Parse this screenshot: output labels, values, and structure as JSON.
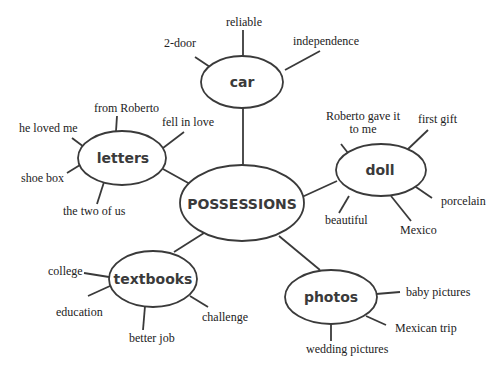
{
  "diagram": {
    "type": "cluster-map",
    "center": {
      "label": "POSSESSIONS"
    },
    "nodes": [
      {
        "id": "car",
        "label": "car",
        "details": [
          "2-door",
          "reliable",
          "independence"
        ]
      },
      {
        "id": "letters",
        "label": "letters",
        "details": [
          "from Roberto",
          "he loved me",
          "fell in love",
          "shoe box",
          "the two of us"
        ]
      },
      {
        "id": "doll",
        "label": "doll",
        "details": [
          "Roberto gave it to me",
          "first gift",
          "porcelain",
          "Mexico",
          "beautiful"
        ]
      },
      {
        "id": "textbooks",
        "label": "textbooks",
        "details": [
          "college",
          "education",
          "better job",
          "challenge"
        ]
      },
      {
        "id": "photos",
        "label": "photos",
        "details": [
          "baby pictures",
          "Mexican trip",
          "wedding pictures"
        ]
      }
    ]
  },
  "labels": {
    "center": "POSSESSIONS",
    "car": "car",
    "car_2door": "2-door",
    "car_reliable": "reliable",
    "car_independence": "independence",
    "letters": "letters",
    "letters_from": "from Roberto",
    "letters_loved": "he loved me",
    "letters_fell": "fell in love",
    "letters_shoebox": "shoe box",
    "letters_two": "the two of us",
    "doll": "doll",
    "doll_gave_1": "Roberto gave it",
    "doll_gave_2": "to me",
    "doll_first": "first gift",
    "doll_porcelain": "porcelain",
    "doll_mexico": "Mexico",
    "doll_beautiful": "beautiful",
    "textbooks": "textbooks",
    "tb_college": "college",
    "tb_education": "education",
    "tb_better": "better job",
    "tb_challenge": "challenge",
    "photos": "photos",
    "ph_baby": "baby pictures",
    "ph_mexican": "Mexican trip",
    "ph_wedding": "wedding pictures"
  }
}
